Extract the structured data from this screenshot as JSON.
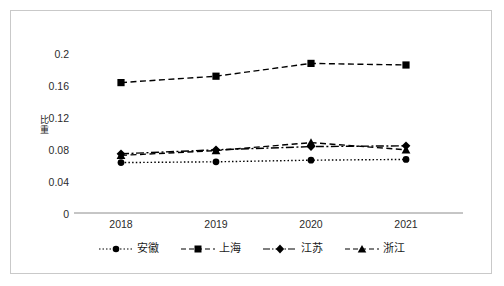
{
  "chart_data": {
    "type": "line",
    "title": "",
    "xlabel": "",
    "ylabel": "比重",
    "categories": [
      "2018",
      "2019",
      "2020",
      "2021"
    ],
    "ylim": [
      0,
      0.2
    ],
    "yticks": [
      "0",
      "0.04",
      "0.08",
      "0.12",
      "0.16",
      "0.2"
    ],
    "ytick_values": [
      0,
      0.04,
      0.08,
      0.12,
      0.16,
      0.2
    ],
    "grid": false,
    "legend_position": "bottom",
    "series": [
      {
        "name": "安徽",
        "marker": "circle",
        "line_style": "dotted",
        "color": "#000000",
        "values": [
          0.063,
          0.064,
          0.066,
          0.067
        ]
      },
      {
        "name": "上海",
        "marker": "square",
        "line_style": "dashed",
        "color": "#000000",
        "values": [
          0.163,
          0.171,
          0.187,
          0.185
        ]
      },
      {
        "name": "江苏",
        "marker": "diamond",
        "line_style": "dash-dot",
        "color": "#000000",
        "values": [
          0.074,
          0.079,
          0.083,
          0.084
        ]
      },
      {
        "name": "浙江",
        "marker": "triangle",
        "line_style": "dashed",
        "color": "#000000",
        "values": [
          0.072,
          0.078,
          0.088,
          0.079
        ]
      }
    ]
  },
  "legend": {
    "items": [
      {
        "label": "安徽"
      },
      {
        "label": "上海"
      },
      {
        "label": "江苏"
      },
      {
        "label": "浙江"
      }
    ]
  }
}
